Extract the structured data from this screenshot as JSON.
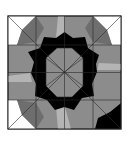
{
  "figure": {
    "colors": {
      "white": "#ffffff",
      "light": "#b4b4b4",
      "mid": "#8c8c8c",
      "dark": "#6e6e6e",
      "black": "#000000",
      "line": "#2a2a2a"
    },
    "bounds": {
      "x": 8,
      "y": 16,
      "size": 113
    },
    "center": {
      "x": 64.5,
      "y": 72.5
    }
  }
}
